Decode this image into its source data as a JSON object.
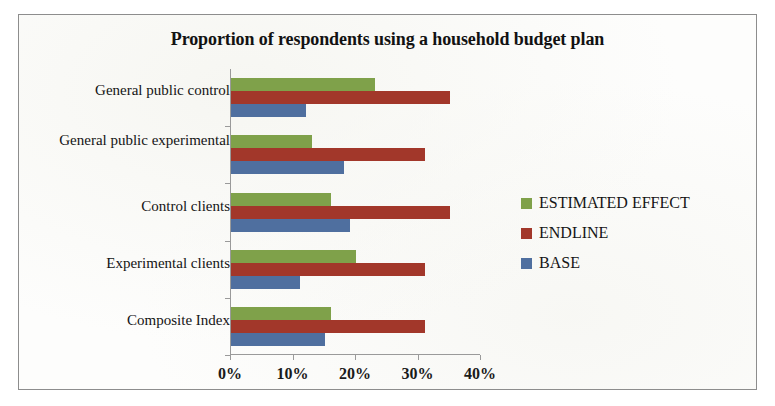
{
  "chart_data": {
    "type": "bar",
    "orientation": "horizontal",
    "title": "Proportion of respondents using a household budget plan",
    "xlabel": "",
    "ylabel": "",
    "xlim": [
      0,
      40
    ],
    "xticks": [
      "0%",
      "10%",
      "20%",
      "30%",
      "40%"
    ],
    "xtick_values": [
      0,
      10,
      20,
      30,
      40
    ],
    "grid": false,
    "legend_position": "right",
    "categories": [
      "General public control",
      "General public experimental",
      "Control clients",
      "Experimental clients",
      "Composite Index"
    ],
    "series": [
      {
        "name": "ESTIMATED EFFECT",
        "color": "#7fa14a",
        "values": [
          23,
          13,
          16,
          20,
          16
        ]
      },
      {
        "name": "ENDLINE",
        "color": "#a2372a",
        "values": [
          35,
          31,
          35,
          31,
          31
        ]
      },
      {
        "name": "BASE",
        "color": "#4f6f9f",
        "values": [
          12,
          18,
          19,
          11,
          15
        ]
      }
    ]
  }
}
